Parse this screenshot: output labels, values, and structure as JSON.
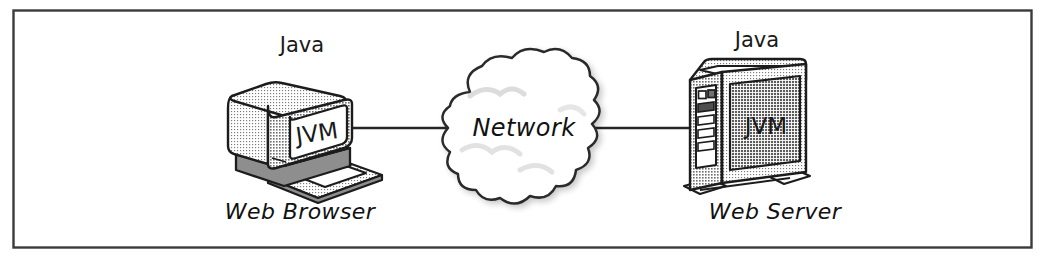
{
  "figure": {
    "type": "diagram",
    "style": "hand-drawn clip-art, grayscale halftone shading",
    "border": {
      "present": true,
      "color": "#3a3a3a",
      "shape": "rectangle"
    },
    "background_color": "#ffffff",
    "ink_color": "#1a1a1a",
    "shade_color": "#b9b9b9"
  },
  "nodes": {
    "client": {
      "top_label": "Java",
      "screen_label": "JVM",
      "bottom_label": "Web Browser",
      "icon": "desktop-computer-icon"
    },
    "network": {
      "label": "Network",
      "icon": "cloud-icon"
    },
    "server": {
      "top_label": "Java",
      "panel_label": "JVM",
      "bottom_label": "Web Server",
      "icon": "server-tower-icon"
    }
  },
  "connections": [
    {
      "from": "client",
      "to": "network",
      "style": "solid-line"
    },
    {
      "from": "network",
      "to": "server",
      "style": "solid-line"
    }
  ]
}
